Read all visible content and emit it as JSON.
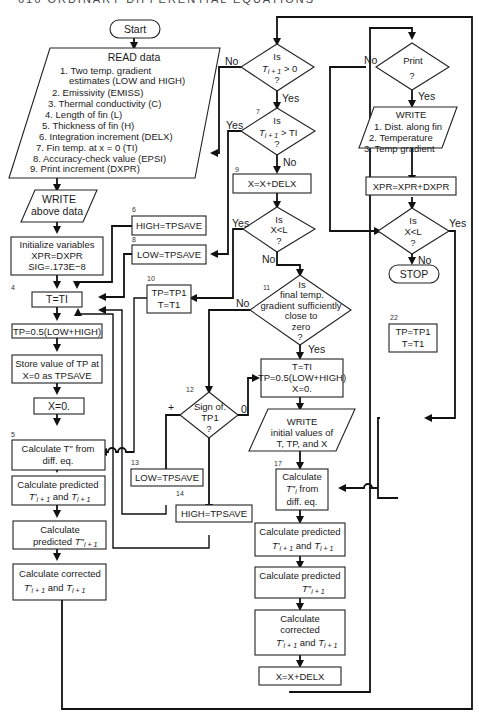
{
  "header": {
    "running_head": "616   ORDINARY DIFFERENTIAL EQUATIONS"
  },
  "nodes": {
    "start": {
      "label": "Start"
    },
    "read": {
      "title": "READ data",
      "items": [
        "1.  Two temp. gradient",
        "estimates (LOW and HIGH)",
        "2.  Emissivity (EMISS)",
        "3.  Thermal conductivity (C)",
        "4.  Length of fin (L)",
        "5.  Thickness of fin (H)",
        "6.  Integration increment (DELX)",
        "7.  Fin temp. at x = 0 (TI)",
        "8.  Accuracy-check value (EPSI)",
        "9.  Print increment (DXPR)"
      ]
    },
    "write_above": {
      "line1": "WRITE",
      "line2": "above data"
    },
    "init": {
      "line1": "Initialize variables",
      "line2": "XPR=DXPR",
      "line3": "SIG=.173E−8"
    },
    "t_eq_ti": {
      "num": "4",
      "label": "T=TI"
    },
    "tp_avg": {
      "label": "TP=0.5(LOW+HIGH)"
    },
    "store_tp": {
      "line1": "Store value of TP at",
      "line2": "X=0 as TPSAVE"
    },
    "x_zero": {
      "label": "X=0."
    },
    "calc_tpp": {
      "num": "5",
      "line1": "Calculate T″ from",
      "line2": "diff. eq."
    },
    "pred1": {
      "line1": "Calculate predicted",
      "line2a": "T′",
      "line2b": "i + 1",
      "line2c": " and ",
      "line2d": "T",
      "line2e": "i + 1"
    },
    "pred2": {
      "line1": "Calculate",
      "line2a": "predicted ",
      "line2b": "T″",
      "line2c": "i + 1"
    },
    "corr": {
      "line1": "Calculate corrected",
      "line2a": "T′",
      "line2b": "i + 1",
      "line2c": " and ",
      "line2d": "T",
      "line2e": "i + 1"
    },
    "d_pos": {
      "line1": "Is",
      "line2a": "T",
      "line2b": "i + 1",
      "line2c": " > 0",
      "line3": "?",
      "no": "No",
      "yes": "Yes"
    },
    "d_gt_ti": {
      "num": "7",
      "line1": "Is",
      "line2a": "T",
      "line2b": "i + 1",
      "line2c": " > TI",
      "line3": "?",
      "yes": "Yes",
      "no": "No"
    },
    "high_save": {
      "num": "6",
      "label": "HIGH=TPSAVE"
    },
    "low_save": {
      "num": "8",
      "label": "LOW=TPSAVE"
    },
    "x_inc": {
      "num": "9",
      "label": "X=X+DELX"
    },
    "d_xl": {
      "line1": "Is",
      "line2": "X<L",
      "line3": "?",
      "yes": "Yes",
      "no": "No"
    },
    "tp_tp1": {
      "num": "10",
      "line1": "TP=TP1",
      "line2": "T=T1"
    },
    "d_grad": {
      "num": "11",
      "line1": "Is",
      "line2": "final temp.",
      "line3": "gradient sufficiently",
      "line4": "close to",
      "line5": "zero",
      "line6": "?",
      "no": "No",
      "yes": "Yes"
    },
    "d_sign": {
      "num": "12",
      "line1": "Sign of.",
      "line2": "TP1",
      "line3": "?",
      "plus": "+",
      "zero": "0"
    },
    "low_save2": {
      "num": "13",
      "label": "LOW=TPSAVE"
    },
    "high_save2": {
      "num": "14",
      "label": "HIGH=TPSAVE"
    },
    "reinit": {
      "line1": "T=TI",
      "line2": "TP=0.5(LOW+HIGH)",
      "line3": "X=0."
    },
    "write_init": {
      "line1": "WRITE",
      "line2": "initial values of",
      "line3": "T, TP, and X"
    },
    "calc_tpp2": {
      "num": "17",
      "line1": "Calculate",
      "line2a": "T″",
      "line2b": "i",
      "line2c": " from",
      "line3": "diff. eq."
    },
    "pred1b": {
      "line1": "Calculate predicted",
      "line2a": "T′",
      "line2b": "i + 1",
      "line2c": " and ",
      "line2d": "T",
      "line2e": "i + 1"
    },
    "pred2b": {
      "line1": "Calculate predicted",
      "line2a": "T″",
      "line2b": "i + 1"
    },
    "corr2": {
      "line1": "Calculate",
      "line2": "corrected",
      "line3a": "T′",
      "line3b": "i + 1",
      "line3c": " and ",
      "line3d": "T",
      "line3e": "i + 1"
    },
    "x_inc2": {
      "label": "X=X+DELX"
    },
    "d_print": {
      "line1": "Print",
      "line2": "?",
      "no": "No",
      "yes": "Yes"
    },
    "write_out": {
      "line1": "WRITE",
      "line2": "1.  Dist. along fin",
      "line3": "2.  Temperature",
      "line4": "3.  Temp gradient"
    },
    "xpr_inc": {
      "label": "XPR=XPR+DXPR"
    },
    "d_xl2": {
      "line1": "Is",
      "line2": "X<L",
      "line3": "?",
      "yes": "Yes",
      "no": "No"
    },
    "stop": {
      "label": "STOP"
    },
    "tp_tp1b": {
      "num": "22",
      "line1": "TP=TP1",
      "line2": "T=T1"
    }
  }
}
